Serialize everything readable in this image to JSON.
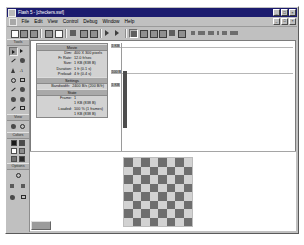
{
  "window": {
    "title": "Flash 5 - [checkers.swf]",
    "app_icon": "flash-icon",
    "minimize": "_",
    "maximize": "□",
    "close": "×",
    "doc_minimize": "_",
    "doc_restore": "□",
    "doc_close": "×"
  },
  "menu": {
    "document_icon": "document-icon",
    "items": [
      {
        "label": "File"
      },
      {
        "label": "Edit"
      },
      {
        "label": "View"
      },
      {
        "label": "Control"
      },
      {
        "label": "Debug"
      },
      {
        "label": "Window"
      },
      {
        "label": "Help"
      }
    ]
  },
  "toolbar": {
    "buttons": [
      {
        "name": "new-document",
        "glyph": "doc"
      },
      {
        "name": "open-document",
        "glyph": "sq"
      },
      {
        "name": "save-document",
        "glyph": "sq"
      },
      {
        "name": "print",
        "glyph": "sq"
      },
      {
        "name": "print-preview",
        "glyph": "sq"
      },
      {
        "name": "cut",
        "glyph": "dk"
      },
      {
        "name": "copy",
        "glyph": "sq"
      },
      {
        "name": "paste",
        "glyph": "sq"
      },
      {
        "name": "undo",
        "glyph": "dk"
      },
      {
        "name": "redo",
        "glyph": "dk"
      },
      {
        "name": "play",
        "glyph": "doc"
      },
      {
        "name": "snap-to-objects",
        "glyph": "dk"
      },
      {
        "name": "smooth",
        "glyph": "dk"
      },
      {
        "name": "straighten",
        "glyph": "dk"
      },
      {
        "name": "rotate",
        "glyph": "dk"
      },
      {
        "name": "scale",
        "glyph": "sq"
      }
    ],
    "right_buttons": [
      {
        "name": "align-left",
        "w": 4
      },
      {
        "name": "align-center",
        "w": 7
      },
      {
        "name": "align-right",
        "w": 6
      },
      {
        "name": "distribute",
        "w": 2
      },
      {
        "name": "match-size",
        "w": 5
      },
      {
        "name": "space-evenly",
        "w": 8
      }
    ]
  },
  "toolbox": {
    "sections": [
      {
        "caption": "Tools"
      },
      {
        "caption": "View"
      },
      {
        "caption": "Colors"
      },
      {
        "caption": "Options"
      }
    ],
    "tools": [
      {
        "name": "arrow-tool",
        "icon": "arrow",
        "selected": true
      },
      {
        "name": "subselect-tool",
        "icon": "arrow"
      },
      {
        "name": "line-tool",
        "icon": "line"
      },
      {
        "name": "lasso-tool",
        "icon": "blob"
      },
      {
        "name": "pen-tool",
        "icon": "pen"
      },
      {
        "name": "text-tool",
        "icon": "text",
        "glyph": "A"
      },
      {
        "name": "oval-tool",
        "icon": "circ"
      },
      {
        "name": "rectangle-tool",
        "icon": "rect"
      },
      {
        "name": "pencil-tool",
        "icon": "line"
      },
      {
        "name": "brush-tool",
        "icon": "blob"
      },
      {
        "name": "ink-bottle-tool",
        "icon": "blob"
      },
      {
        "name": "paint-bucket-tool",
        "icon": "blob"
      },
      {
        "name": "dropper-tool",
        "icon": "line"
      },
      {
        "name": "eraser-tool",
        "icon": "rect"
      }
    ],
    "view_tools": [
      {
        "name": "hand-tool",
        "icon": "blob"
      },
      {
        "name": "zoom-tool",
        "icon": "circ"
      }
    ],
    "color_tools": [
      {
        "name": "stroke-color",
        "color": "#1a1a1a"
      },
      {
        "name": "fill-color",
        "color": "#4a4a4a"
      },
      {
        "name": "default-colors",
        "color": "#ffffff"
      },
      {
        "name": "swap-colors",
        "color": "#8b8b8b"
      },
      {
        "name": "no-color",
        "color": "#6f6f6f"
      },
      {
        "name": "black-white",
        "color": "#2b2b2b"
      }
    ],
    "option_tools": [
      {
        "name": "magnet-option",
        "icon": "magnet"
      },
      {
        "name": "smooth-option",
        "icon": "smooth"
      },
      {
        "name": "straighten-option",
        "icon": "straighten"
      },
      {
        "name": "rotate-option",
        "icon": "rotate"
      },
      {
        "name": "scale-option",
        "icon": "scale"
      }
    ]
  },
  "profiler": {
    "sections": [
      {
        "header": "Movie",
        "rows": [
          {
            "key": "Dim:",
            "value": "400 X 300 pixels"
          },
          {
            "key": "Fr Rate:",
            "value": "12.0 fr/sec"
          },
          {
            "key": "Size:",
            "value": "1 KB (838 B)"
          },
          {
            "key": "Duration:",
            "value": "1 fr (0.1 s)"
          },
          {
            "key": "Preload:",
            "value": "4 fr (0.4 s)"
          }
        ]
      },
      {
        "header": "Settings",
        "rows": [
          {
            "key": "Bandwidth:",
            "value": "2400 B/s (200 B/fr)"
          }
        ]
      },
      {
        "header": "State",
        "rows": [
          {
            "key": "Frame:",
            "value": "1"
          },
          {
            "key": "",
            "value": "1 KB (838 B)"
          },
          {
            "key": "Loaded:",
            "value": "100 % (1 frames)"
          },
          {
            "key": "",
            "value": "1 KB (838 B)"
          }
        ]
      }
    ]
  },
  "chart_data": {
    "type": "bar",
    "xlabel": "Frame",
    "ylabel": "Bytes",
    "categories": [
      "1"
    ],
    "values": [
      838
    ],
    "ytick_labels": [
      "1 KB",
      "100 B"
    ],
    "ylim": [
      0,
      1024
    ],
    "grid": true,
    "legend": "none",
    "bar_color": "#4d4d4d"
  },
  "stage": {
    "name": "checkerboard",
    "rows": 8,
    "cols": 8,
    "dark_color": "#6e6e6e",
    "light_color": "#d2d2d2"
  }
}
